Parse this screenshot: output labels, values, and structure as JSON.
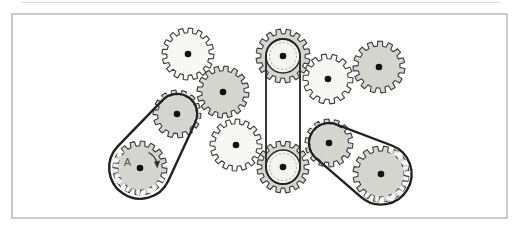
{
  "palette": {
    "background": "#ffffff",
    "frame_stroke": "#a8a8a8",
    "gear_gray": "#d5d5cf",
    "gear_light": "#f7f7f3",
    "gear_stroke": "#3c3c38",
    "belt": "#222222",
    "hub_dot": "#111111",
    "pulley_fill": "#f3f3ef",
    "pulley_stroke": "#2a2a28",
    "dashed_ring": "#b0b0a8",
    "ghost_dash": "#f6f6f2",
    "label_color": "#55554f",
    "artifact": "#dcdcdc"
  },
  "frame": {
    "x": 12,
    "y": 14,
    "width": 495,
    "height": 204,
    "stroke_width": 1.2
  },
  "artifact_line": {
    "x1": 22,
    "y1": 2.5,
    "x2": 500,
    "y2": 2.5,
    "color": "#dcdcdc"
  },
  "diagram": {
    "gears": [
      {
        "name": "gear-top-left",
        "cx": 188,
        "cy": 54,
        "r": 26,
        "teeth": 16,
        "depth": 4.8,
        "phase": 0.1,
        "shade": "light"
      },
      {
        "name": "gear-upper-middle",
        "cx": 223,
        "cy": 92,
        "r": 26,
        "teeth": 16,
        "depth": 4.8,
        "phase": 0.12,
        "shade": "gray"
      },
      {
        "name": "gear-upper-right-white",
        "cx": 328,
        "cy": 79,
        "r": 25,
        "teeth": 14,
        "depth": 4.8,
        "phase": 0.05,
        "shade": "light"
      },
      {
        "name": "gear-belt-top",
        "cx": 283,
        "cy": 56,
        "r": 27,
        "teeth": 16,
        "depth": 4.8,
        "phase": 0.21,
        "shade": "gray",
        "pulley": {
          "type": "disc",
          "r": 17
        }
      },
      {
        "name": "gear-far-right",
        "cx": 379,
        "cy": 67,
        "r": 26,
        "teeth": 15,
        "depth": 5.0,
        "phase": 0.15,
        "shade": "gray"
      },
      {
        "name": "gear-mid-white",
        "cx": 236,
        "cy": 145,
        "r": 26,
        "teeth": 16,
        "depth": 4.8,
        "phase": 0.06,
        "shade": "light"
      },
      {
        "name": "gear-belt-left-upper",
        "cx": 177,
        "cy": 114,
        "r": 24,
        "teeth": 14,
        "depth": 4.6,
        "phase": 0.08,
        "shade": "gray"
      },
      {
        "name": "gear-belt-bottom",
        "cx": 283,
        "cy": 167,
        "r": 26,
        "teeth": 16,
        "depth": 4.8,
        "phase": 0.2,
        "shade": "gray",
        "pulley": {
          "type": "disc",
          "r": 17
        }
      },
      {
        "name": "gear-belt-right-upper",
        "cx": 329,
        "cy": 143,
        "r": 24,
        "teeth": 14,
        "depth": 4.6,
        "phase": 0.12,
        "shade": "gray"
      },
      {
        "name": "gear-a",
        "cx": 140,
        "cy": 168,
        "r": 27,
        "teeth": 16,
        "depth": 4.8,
        "phase": 0.1,
        "shade": "gray",
        "label": "A",
        "label_dx": -12.5,
        "label_dy": -2
      },
      {
        "name": "gear-bottom-right",
        "cx": 381,
        "cy": 174,
        "r": 28,
        "teeth": 16,
        "depth": 5.0,
        "phase": 0.18,
        "shade": "gray"
      }
    ],
    "belts": [
      {
        "name": "belt-left",
        "from": "gear-a",
        "r1": 31,
        "to": "gear-belt-left-upper",
        "r2": 20,
        "width": 2.4,
        "ghost1": {
          "r": 24.5,
          "w": 5
        },
        "ghost2": {
          "r": 20,
          "w": 4
        }
      },
      {
        "name": "belt-middle",
        "from": "gear-belt-bottom",
        "r1": 17,
        "to": "gear-belt-top",
        "r2": 17,
        "width": 1.8
      },
      {
        "name": "belt-right",
        "from": "gear-bottom-right",
        "r1": 30.5,
        "to": "gear-belt-right-upper",
        "r2": 20,
        "width": 2.4,
        "ghost1": {
          "r": 25.5,
          "w": 5
        },
        "ghost2": {
          "r": 20,
          "w": 4
        }
      }
    ],
    "rotation_arrow": {
      "gear": "gear-a",
      "arc_path": "M148.5 152.5 A15.5 15.5 0 0 1 156.6 162.0",
      "head_points": "154.0,161.8 160.2,160.6 157.3,168.4",
      "color": "#333333"
    }
  }
}
